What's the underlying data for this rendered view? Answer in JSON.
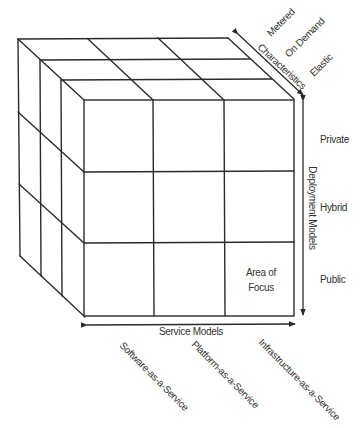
{
  "diagram": {
    "type": "cloud-cube-model",
    "cell_label": "Area of Focus",
    "cell_label_lines": [
      "Area of",
      "Focus"
    ],
    "axes": {
      "service": {
        "title": "Service Models",
        "items": [
          "Software-as-a-Service",
          "Platform-as-a-Service",
          "Infrastructure-as-a-Service"
        ]
      },
      "deployment": {
        "title": "Deployment Models",
        "items": [
          "Private",
          "Hybrid",
          "Public"
        ]
      },
      "characteristics": {
        "title": "Characteristics",
        "items": [
          "Metered",
          "On Demand",
          "Elastic"
        ]
      }
    },
    "colors": {
      "line": "#2b2b2b",
      "text": "#333333",
      "background": "#ffffff"
    }
  }
}
